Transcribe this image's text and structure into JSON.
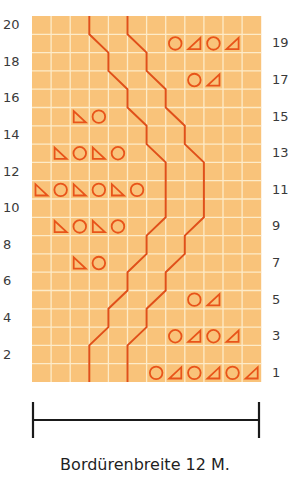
{
  "colors": {
    "cell": "#F9C37A",
    "grid_line": "#FDEBC8",
    "symbol": "#E8541A",
    "line": "#E0501A",
    "text": "#3a3a3a"
  },
  "grid": {
    "columns": 12,
    "rows": 20,
    "left": 32,
    "top": 16,
    "cell_width": 19.1,
    "cell_height": 18.3
  },
  "row_labels": {
    "left": [
      "2",
      "4",
      "6",
      "8",
      "10",
      "12",
      "14",
      "16",
      "18",
      "20"
    ],
    "right": [
      "1",
      "3",
      "5",
      "7",
      "9",
      "11",
      "13",
      "15",
      "17",
      "19"
    ]
  },
  "symbols": {
    "legend_note": "circle = yarn over, triangle-left = decrease leaning left, triangle-right = decrease leaning right",
    "rows": [
      {
        "row": 19,
        "cells": [
          {
            "col": 7,
            "type": "circle"
          },
          {
            "col": 8,
            "type": "tri-right"
          },
          {
            "col": 9,
            "type": "circle"
          },
          {
            "col": 10,
            "type": "tri-right"
          }
        ]
      },
      {
        "row": 17,
        "cells": [
          {
            "col": 8,
            "type": "circle"
          },
          {
            "col": 9,
            "type": "tri-right"
          }
        ]
      },
      {
        "row": 15,
        "cells": [
          {
            "col": 2,
            "type": "tri-left"
          },
          {
            "col": 3,
            "type": "circle"
          }
        ]
      },
      {
        "row": 13,
        "cells": [
          {
            "col": 1,
            "type": "tri-left"
          },
          {
            "col": 2,
            "type": "circle"
          },
          {
            "col": 3,
            "type": "tri-left"
          },
          {
            "col": 4,
            "type": "circle"
          }
        ]
      },
      {
        "row": 11,
        "cells": [
          {
            "col": 0,
            "type": "tri-left"
          },
          {
            "col": 1,
            "type": "circle"
          },
          {
            "col": 2,
            "type": "tri-left"
          },
          {
            "col": 3,
            "type": "circle"
          },
          {
            "col": 4,
            "type": "tri-left"
          },
          {
            "col": 5,
            "type": "circle"
          }
        ]
      },
      {
        "row": 9,
        "cells": [
          {
            "col": 1,
            "type": "tri-left"
          },
          {
            "col": 2,
            "type": "circle"
          },
          {
            "col": 3,
            "type": "tri-left"
          },
          {
            "col": 4,
            "type": "circle"
          }
        ]
      },
      {
        "row": 7,
        "cells": [
          {
            "col": 2,
            "type": "tri-left"
          },
          {
            "col": 3,
            "type": "circle"
          }
        ]
      },
      {
        "row": 5,
        "cells": [
          {
            "col": 8,
            "type": "circle"
          },
          {
            "col": 9,
            "type": "tri-right"
          }
        ]
      },
      {
        "row": 3,
        "cells": [
          {
            "col": 7,
            "type": "circle"
          },
          {
            "col": 8,
            "type": "tri-right"
          },
          {
            "col": 9,
            "type": "circle"
          },
          {
            "col": 10,
            "type": "tri-right"
          }
        ]
      },
      {
        "row": 1,
        "cells": [
          {
            "col": 6,
            "type": "circle"
          },
          {
            "col": 7,
            "type": "tri-right"
          },
          {
            "col": 8,
            "type": "circle"
          },
          {
            "col": 9,
            "type": "tri-right"
          },
          {
            "col": 10,
            "type": "circle"
          },
          {
            "col": 11,
            "type": "tri-right"
          }
        ]
      }
    ]
  },
  "cable_lines": [
    {
      "name": "left-line",
      "boundary_by_row_top_from_row1": [
        3,
        3,
        4,
        4,
        5,
        5,
        6,
        6,
        7,
        7,
        7,
        7,
        6,
        6,
        5,
        5,
        4,
        4,
        3,
        3
      ],
      "path_points": [
        [
          3,
          0
        ],
        [
          3,
          2
        ],
        [
          4,
          3
        ],
        [
          4,
          4
        ],
        [
          5,
          5
        ],
        [
          5,
          6
        ],
        [
          6,
          7
        ],
        [
          6,
          8
        ],
        [
          7,
          9
        ],
        [
          7,
          12
        ],
        [
          6,
          13
        ],
        [
          6,
          14
        ],
        [
          5,
          15
        ],
        [
          5,
          16
        ],
        [
          4,
          17
        ],
        [
          4,
          18
        ],
        [
          3,
          19
        ],
        [
          3,
          20
        ]
      ]
    },
    {
      "name": "right-line",
      "path_points": [
        [
          5,
          0
        ],
        [
          5,
          2
        ],
        [
          6,
          3
        ],
        [
          6,
          4
        ],
        [
          7,
          5
        ],
        [
          7,
          6
        ],
        [
          8,
          7
        ],
        [
          8,
          8
        ],
        [
          9,
          9
        ],
        [
          9,
          12
        ],
        [
          8,
          13
        ],
        [
          8,
          14
        ],
        [
          7,
          15
        ],
        [
          7,
          16
        ],
        [
          6,
          17
        ],
        [
          6,
          18
        ],
        [
          5,
          19
        ],
        [
          5,
          20
        ]
      ]
    }
  ],
  "scale_bar": {
    "x1": 33,
    "x2": 259,
    "y": 420,
    "tick_top": 402,
    "tick_bottom": 438
  },
  "caption": "Bordürenbreite 12 M."
}
